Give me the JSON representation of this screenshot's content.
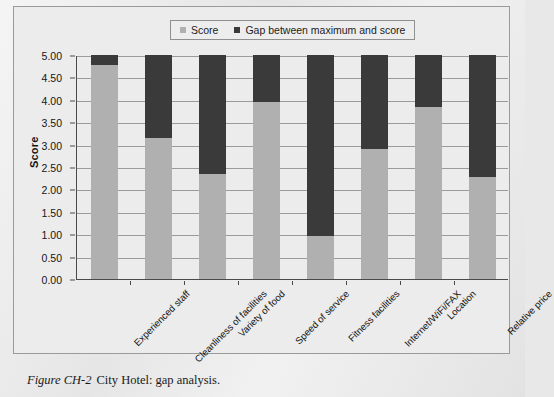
{
  "figure": {
    "number": "Figure CH-2",
    "caption": "City Hotel: gap analysis."
  },
  "colors": {
    "score": "#b0b0b0",
    "gap": "#3a3a3a",
    "plot_background": "#ececec",
    "gridline": "#9b9b9b",
    "axis": "#4a4a4a",
    "page_background": "#e8e8e8"
  },
  "legend": {
    "position": "top-center",
    "entries": [
      {
        "label": "Score",
        "swatch": "#b0b0b0"
      },
      {
        "label": "Gap between maximum and score",
        "swatch": "#3a3a3a"
      }
    ]
  },
  "chart_data": {
    "type": "bar",
    "stacked": true,
    "title": "",
    "subtitle": "",
    "xlabel": "",
    "ylabel": "Score",
    "ylim": [
      0,
      5
    ],
    "ytick_step": 0.5,
    "grid": true,
    "max_score": 5.0,
    "categories": [
      "Experienced staff",
      "Cleanliness of facilities",
      "Variety of food",
      "Speed of service",
      "Fitness facilities",
      "Internet/WiFi/FAX",
      "Location",
      "Relative price"
    ],
    "ytick_labels": [
      "5.00",
      "4.50",
      "4.00",
      "3.50",
      "3.00",
      "2.50",
      "2.00",
      "1.50",
      "1.00",
      "0.50",
      "0.00"
    ],
    "ytick_values": [
      5.0,
      4.5,
      4.0,
      3.5,
      3.0,
      2.5,
      2.0,
      1.5,
      1.0,
      0.5,
      0.0
    ],
    "series": [
      {
        "name": "Score",
        "color": "#b0b0b0",
        "values": [
          4.78,
          3.15,
          2.35,
          3.95,
          0.95,
          2.9,
          3.85,
          2.28
        ]
      },
      {
        "name": "Gap between maximum and score",
        "color": "#3a3a3a",
        "values": [
          0.22,
          1.85,
          2.65,
          1.05,
          4.05,
          2.1,
          1.15,
          2.72
        ]
      }
    ]
  }
}
